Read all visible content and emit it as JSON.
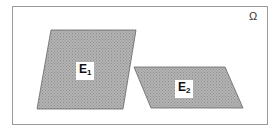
{
  "diagram": {
    "sample_space": {
      "label": "Ω"
    },
    "sets": [
      {
        "id": "E1",
        "letter": "E",
        "subscript": "1"
      },
      {
        "id": "E2",
        "letter": "E",
        "subscript": "2"
      }
    ],
    "colors": {
      "fill": "#a9a9a9",
      "border": "#555555",
      "frame": "#9a9a9a"
    }
  }
}
